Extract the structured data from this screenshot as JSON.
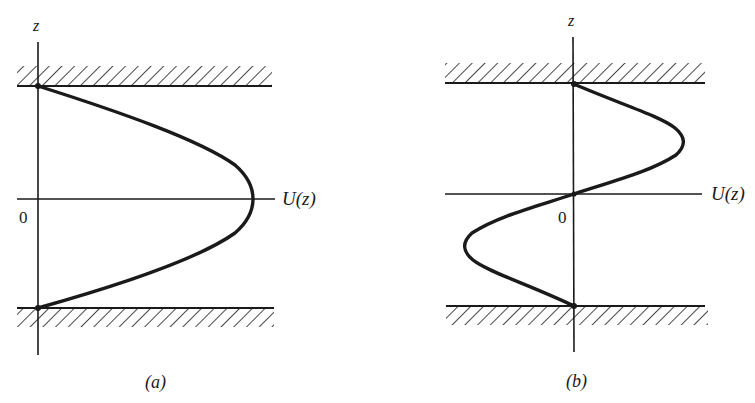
{
  "figure": {
    "colors": {
      "ink": "#1a1a1a",
      "background": "#ffffff"
    },
    "panels": [
      {
        "id": "a",
        "caption": "(a)",
        "vertical_axis_label": "z",
        "horizontal_axis_label": "U(z)",
        "origin_label": "0",
        "profile_shape": "parabolic (plane Poiseuille flow), zero at both walls, maximum at centerline",
        "walls": [
          "top",
          "bottom"
        ]
      },
      {
        "id": "b",
        "caption": "(b)",
        "vertical_axis_label": "z",
        "horizontal_axis_label": "U(z)",
        "origin_label": "0",
        "profile_shape": "antisymmetric S-shaped profile, zero at both walls and at centerline, positive in upper half, negative in lower half",
        "walls": [
          "top",
          "bottom"
        ]
      }
    ]
  }
}
